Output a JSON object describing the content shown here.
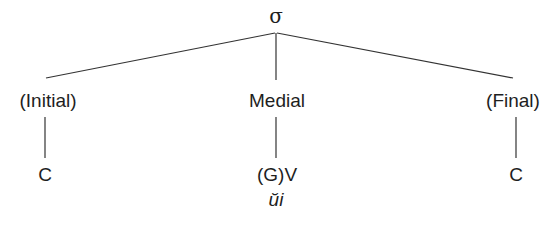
{
  "diagram": {
    "type": "syllable-structure-tree",
    "root": {
      "label": "σ"
    },
    "nodes": [
      {
        "id": "initial",
        "label": "(Initial)",
        "child": "C"
      },
      {
        "id": "medial",
        "label": "Medial",
        "child": "(G)V",
        "example": "ŭi"
      },
      {
        "id": "final",
        "label": "(Final)",
        "child": "C"
      }
    ],
    "edges": [
      [
        "σ",
        "(Initial)"
      ],
      [
        "σ",
        "Medial"
      ],
      [
        "σ",
        "(Final)"
      ],
      [
        "(Initial)",
        "C"
      ],
      [
        "Medial",
        "(G)V"
      ],
      [
        "(Final)",
        "C"
      ]
    ],
    "line_color": "#333333"
  }
}
